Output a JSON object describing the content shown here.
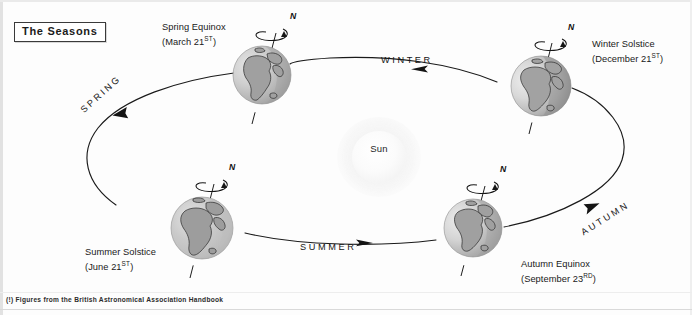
{
  "figure": {
    "title": "The Seasons",
    "footnote": "(!) Figures from the British Astronomical Association Handbook"
  },
  "sun": {
    "label": "Sun"
  },
  "axis_markers": {
    "north_pole": "N"
  },
  "positions": [
    {
      "id": "spring-equinox",
      "name": "Spring Equinox",
      "date_text": "(March 21",
      "date_suffix": "ST",
      "date_close": ")",
      "pole_label": "N"
    },
    {
      "id": "winter-solstice",
      "name": "Winter Solstice",
      "date_text": "(December 21",
      "date_suffix": "ST",
      "date_close": ")",
      "pole_label": "N"
    },
    {
      "id": "summer-solstice",
      "name": "Summer Solstice",
      "date_text": "(June 21",
      "date_suffix": "ST",
      "date_close": ")",
      "pole_label": "N"
    },
    {
      "id": "autumn-equinox",
      "name": "Autumn Equinox",
      "date_text": "(September 23",
      "date_suffix": "RD",
      "date_close": ")",
      "pole_label": "N"
    }
  ],
  "season_arcs": [
    {
      "id": "spring",
      "label": "SPRING"
    },
    {
      "id": "winter",
      "label": "WINTER"
    },
    {
      "id": "summer",
      "label": "SUMMER"
    },
    {
      "id": "autumn",
      "label": "AUTUMN"
    }
  ],
  "colors": {
    "ink": "#151515",
    "orbit_line": "#1a1a1a",
    "ocean_light": "#dedede",
    "ocean_mid": "#b9b9b9",
    "land": "#9a9a9a",
    "shadow": "#8f8f8f",
    "sun_core": "#fbfbfb",
    "page": "#ffffff"
  }
}
